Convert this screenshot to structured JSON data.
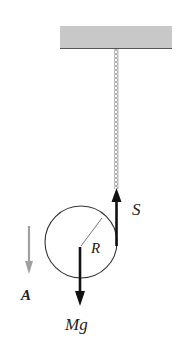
{
  "diagram": {
    "labels": {
      "tension": "S",
      "radius": "R",
      "acceleration": "A",
      "weight": "Mg"
    },
    "colors": {
      "ceiling_fill": "#c8c8c8",
      "ceiling_edge": "#555555",
      "rope": "#888888",
      "force_arrow": "#111111",
      "accel_arrow": "#a0a0a0",
      "circle": "#333333"
    }
  }
}
